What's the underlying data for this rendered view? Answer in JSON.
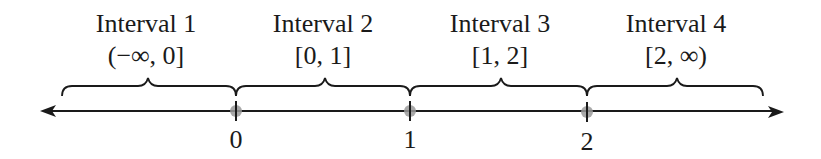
{
  "diagram": {
    "type": "number-line-intervals",
    "intervals": [
      {
        "name": "Interval 1",
        "notation": "(−∞, 0]",
        "center_x": 146
      },
      {
        "name": "Interval 2",
        "notation": "[0, 1]",
        "center_x": 323
      },
      {
        "name": "Interval 3",
        "notation": "[1, 2]",
        "center_x": 499
      },
      {
        "name": "Interval 4",
        "notation": "[2, ∞)",
        "center_x": 675
      }
    ],
    "points": [
      {
        "label": "0",
        "x": 236
      },
      {
        "label": "1",
        "x": 410
      },
      {
        "label": "2",
        "x": 587
      }
    ],
    "colors": {
      "line": "#1a1a1a",
      "point": "#9a9a9a"
    }
  }
}
